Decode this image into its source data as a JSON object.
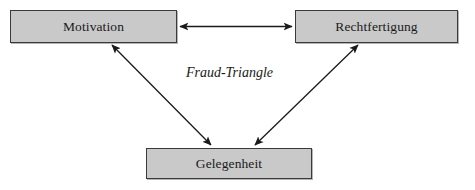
{
  "diagram": {
    "caption": "Fraud-Triangle",
    "background_color": "#ffffff",
    "node_fill_color": "#c9c9c9",
    "node_border_color": "#3a3a3a",
    "edge_color": "#1a1a1a",
    "nodes": [
      {
        "id": "motivation",
        "label": "Motivation",
        "x": 10,
        "y": 10,
        "width": 167,
        "height": 33
      },
      {
        "id": "rechtfertigung",
        "label": "Rechtfertigung",
        "x": 295,
        "y": 10,
        "width": 163,
        "height": 33
      },
      {
        "id": "gelegenheit",
        "label": "Gelegenheit",
        "x": 146,
        "y": 148,
        "width": 166,
        "height": 31
      }
    ],
    "edges": [
      {
        "id": "motivation-rechtfertigung",
        "from": "motivation",
        "to": "rechtfertigung",
        "style": "double-arrow",
        "orientation": "horizontal"
      },
      {
        "id": "motivation-gelegenheit",
        "from": "motivation",
        "to": "gelegenheit",
        "style": "double-arrow",
        "orientation": "diagonal"
      },
      {
        "id": "gelegenheit-rechtfertigung",
        "from": "gelegenheit",
        "to": "rechtfertigung",
        "style": "double-arrow",
        "orientation": "diagonal"
      }
    ]
  }
}
